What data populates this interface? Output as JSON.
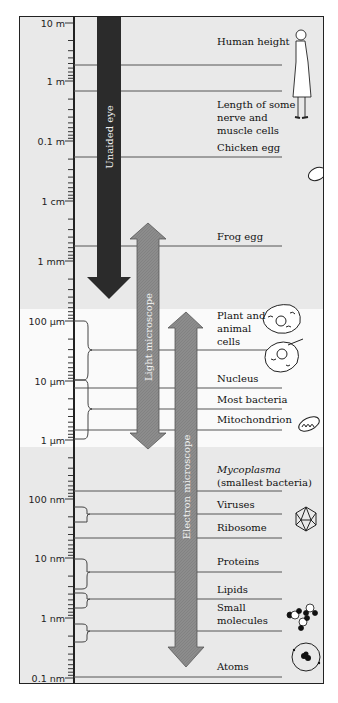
{
  "scale": {
    "ticks": [
      {
        "label": "10 m",
        "y": 22
      },
      {
        "label": "1 m",
        "y": 80
      },
      {
        "label": "0.1 m",
        "y": 140
      },
      {
        "label": "1 cm",
        "y": 200
      },
      {
        "label": "1 mm",
        "y": 260
      },
      {
        "label": "100 µm",
        "y": 320
      },
      {
        "label": "10 µm",
        "y": 380
      },
      {
        "label": "1 µm",
        "y": 439
      },
      {
        "label": "100 nm",
        "y": 498
      },
      {
        "label": "10 nm",
        "y": 557
      },
      {
        "label": "1 nm",
        "y": 617
      },
      {
        "label": "0.1 nm",
        "y": 677
      }
    ]
  },
  "ranges": {
    "unaided_eye": {
      "label": "Unaided eye",
      "color": "#2b2b2b"
    },
    "light_microscope": {
      "label": "Light microscope",
      "color": "#8a8a8a"
    },
    "electron_microscope": {
      "label": "Electron microscope",
      "color": "#8a8a8a"
    }
  },
  "objects": {
    "human_height": "Human height",
    "nerve_cells": [
      "Length of some",
      "nerve and",
      "muscle cells"
    ],
    "chicken_egg": "Chicken egg",
    "frog_egg": "Frog egg",
    "plant_animal_cells": [
      "Plant and",
      "animal",
      "cells"
    ],
    "nucleus": "Nucleus",
    "most_bacteria": "Most bacteria",
    "mitochondrion": "Mitochondrion",
    "mycoplasma": "Mycoplasma",
    "mycoplasma_note": "(smallest bacteria)",
    "viruses": "Viruses",
    "ribosome": "Ribosome",
    "proteins": "Proteins",
    "lipids": "Lipids",
    "small_molecules": [
      "Small",
      "molecules"
    ],
    "atoms": "Atoms"
  },
  "icons": [
    "woman-icon",
    "egg-icon",
    "plant-cell-icon",
    "animal-cell-icon",
    "mitochondrion-icon",
    "virus-icon",
    "molecules-icon",
    "atom-icon"
  ]
}
